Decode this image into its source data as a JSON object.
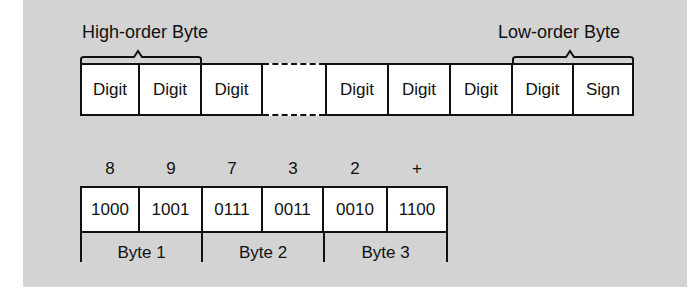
{
  "top_row": {
    "high_label": "High-order Byte",
    "low_label": "Low-order Byte",
    "cells": [
      {
        "label": "Digit",
        "x": 80,
        "w": 60
      },
      {
        "label": "Digit",
        "x": 139,
        "w": 63
      },
      {
        "label": "Digit",
        "x": 201,
        "w": 62
      },
      {
        "label": "Digit",
        "x": 325,
        "w": 64
      },
      {
        "label": "Digit",
        "x": 388,
        "w": 63
      },
      {
        "label": "Digit",
        "x": 450,
        "w": 63
      },
      {
        "label": "Digit",
        "x": 512,
        "w": 62
      },
      {
        "label": "Sign",
        "x": 573,
        "w": 61
      }
    ]
  },
  "bottom_row": {
    "digits": [
      "8",
      "9",
      "7",
      "3",
      "2",
      "+"
    ],
    "codes": [
      "1000",
      "1001",
      "0111",
      "0011",
      "0010",
      "1100"
    ],
    "bytes": [
      "Byte 1",
      "Byte 2",
      "Byte 3"
    ]
  },
  "colors": {
    "panel_background": "#d3d3d3",
    "cell_background": "#ffffff",
    "line": "#111111"
  }
}
